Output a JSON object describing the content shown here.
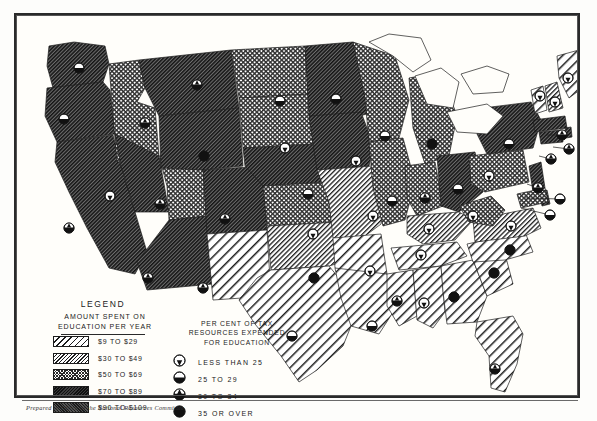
{
  "document": {
    "type": "thematic-choropleth-map",
    "region": "United States",
    "caption": "Prepared in Office of the National Resources Committee"
  },
  "legend": {
    "title": "LEGEND",
    "subtitle_line1": "AMOUNT SPENT ON",
    "subtitle_line2": "EDUCATION PER YEAR",
    "swatches": [
      {
        "label": "$9 TO $29",
        "pattern": "wide-diagonal-hatch",
        "class": "p1"
      },
      {
        "label": "$30 TO $49",
        "pattern": "dense-diagonal-hatch",
        "class": "p2"
      },
      {
        "label": "$50 TO $69",
        "pattern": "crosshatch",
        "class": "p3"
      },
      {
        "label": "$70 TO $89",
        "pattern": "dark-diagonal-hatch",
        "class": "p4"
      },
      {
        "label": "$90 TO $109",
        "pattern": "dense-stipple",
        "class": "p5"
      }
    ],
    "symbol_header_line1": "PER CENT OF TAX",
    "symbol_header_line2": "RESOURCES EXPENDED",
    "symbol_header_line3": "FOR EDUCATION",
    "symbols": [
      {
        "label": "LESS THAN 25",
        "icon": "circle-mostly-white",
        "fill": 0.18
      },
      {
        "label": "25  TO  29",
        "icon": "circle-half-dark",
        "fill": 0.5
      },
      {
        "label": "30  TO  34",
        "icon": "circle-mostly-dark",
        "fill": 0.8
      },
      {
        "label": "35 OR OVER",
        "icon": "circle-solid-dark",
        "fill": 1.0
      }
    ]
  },
  "colors": {
    "ink": "#1c1c1c",
    "paper": "#fffefa",
    "frame": "#2a2a2a"
  },
  "chart_data": {
    "type": "map",
    "value_field": "spending_tier",
    "symbol_field": "tax_percent_tier",
    "tiers": [
      "$9 TO $29",
      "$30 TO $49",
      "$50 TO $69",
      "$70 TO $89",
      "$90 TO $109"
    ],
    "symbol_tiers": [
      "LESS THAN 25",
      "25 TO 29",
      "30 TO 34",
      "35 OR OVER"
    ],
    "states": [
      {
        "name": "WA",
        "tier": 4,
        "sym": 1,
        "cx": 62,
        "cy": 52,
        "lx": 62,
        "ly": 52
      },
      {
        "name": "OR",
        "tier": 4,
        "sym": 1,
        "cx": 47,
        "cy": 103,
        "lx": 47,
        "ly": 103
      },
      {
        "name": "CA",
        "tier": 4,
        "sym": 2,
        "cx": 52,
        "cy": 212,
        "lx": 52,
        "ly": 212
      },
      {
        "name": "ID",
        "tier": 3,
        "sym": 2,
        "cx": 128,
        "cy": 107,
        "lx": 128,
        "ly": 107
      },
      {
        "name": "NV",
        "tier": 4,
        "sym": 0,
        "cx": 93,
        "cy": 180,
        "lx": 93,
        "ly": 180
      },
      {
        "name": "UT",
        "tier": 3,
        "sym": 2,
        "cx": 143,
        "cy": 188,
        "lx": 143,
        "ly": 188
      },
      {
        "name": "AZ",
        "tier": 4,
        "sym": 2,
        "cx": 131,
        "cy": 262,
        "lx": 131,
        "ly": 262
      },
      {
        "name": "MT",
        "tier": 4,
        "sym": 2,
        "cx": 180,
        "cy": 69,
        "lx": 180,
        "ly": 69
      },
      {
        "name": "WY",
        "tier": 4,
        "sym": 3,
        "cx": 187,
        "cy": 140,
        "lx": 187,
        "ly": 140
      },
      {
        "name": "CO",
        "tier": 4,
        "sym": 2,
        "cx": 208,
        "cy": 203,
        "lx": 208,
        "ly": 203
      },
      {
        "name": "NM",
        "tier": 1,
        "sym": 2,
        "cx": 186,
        "cy": 272,
        "lx": 186,
        "ly": 272
      },
      {
        "name": "ND",
        "tier": 3,
        "sym": 1,
        "cx": 263,
        "cy": 85,
        "lx": 263,
        "ly": 85
      },
      {
        "name": "SD",
        "tier": 3,
        "sym": 0,
        "cx": 268,
        "cy": 132,
        "lx": 268,
        "ly": 132
      },
      {
        "name": "NE",
        "tier": 4,
        "sym": 1,
        "cx": 291,
        "cy": 178,
        "lx": 291,
        "ly": 178
      },
      {
        "name": "KS",
        "tier": 3,
        "sym": 0,
        "cx": 296,
        "cy": 218,
        "lx": 296,
        "ly": 218
      },
      {
        "name": "OK",
        "tier": 2,
        "sym": 3,
        "cx": 297,
        "cy": 262,
        "lx": 297,
        "ly": 262
      },
      {
        "name": "TX",
        "tier": 1,
        "sym": 1,
        "cx": 275,
        "cy": 320,
        "lx": 275,
        "ly": 320
      },
      {
        "name": "MN",
        "tier": 4,
        "sym": 1,
        "cx": 319,
        "cy": 83,
        "lx": 319,
        "ly": 83
      },
      {
        "name": "IA",
        "tier": 4,
        "sym": 0,
        "cx": 339,
        "cy": 145,
        "lx": 339,
        "ly": 145
      },
      {
        "name": "MO",
        "tier": 2,
        "sym": 0,
        "cx": 356,
        "cy": 200,
        "lx": 356,
        "ly": 200
      },
      {
        "name": "AR",
        "tier": 1,
        "sym": 0,
        "cx": 353,
        "cy": 255,
        "lx": 353,
        "ly": 255
      },
      {
        "name": "LA",
        "tier": 1,
        "sym": 1,
        "cx": 355,
        "cy": 310,
        "lx": 355,
        "ly": 310
      },
      {
        "name": "WI",
        "tier": 3,
        "sym": 1,
        "cx": 368,
        "cy": 120,
        "lx": 368,
        "ly": 120
      },
      {
        "name": "IL",
        "tier": 3,
        "sym": 1,
        "cx": 375,
        "cy": 185,
        "lx": 375,
        "ly": 185
      },
      {
        "name": "MI",
        "tier": 3,
        "sym": 3,
        "cx": 415,
        "cy": 128,
        "lx": 415,
        "ly": 128
      },
      {
        "name": "IN",
        "tier": 3,
        "sym": 2,
        "cx": 408,
        "cy": 182,
        "lx": 408,
        "ly": 182
      },
      {
        "name": "OH",
        "tier": 4,
        "sym": 1,
        "cx": 441,
        "cy": 173,
        "lx": 441,
        "ly": 173
      },
      {
        "name": "KY",
        "tier": 2,
        "sym": 0,
        "cx": 412,
        "cy": 213,
        "lx": 412,
        "ly": 213
      },
      {
        "name": "TN",
        "tier": 1,
        "sym": 0,
        "cx": 404,
        "cy": 239,
        "lx": 404,
        "ly": 239
      },
      {
        "name": "MS",
        "tier": 1,
        "sym": 2,
        "cx": 380,
        "cy": 285,
        "lx": 380,
        "ly": 285
      },
      {
        "name": "AL",
        "tier": 1,
        "sym": 0,
        "cx": 407,
        "cy": 287,
        "lx": 407,
        "ly": 287
      },
      {
        "name": "GA",
        "tier": 1,
        "sym": 3,
        "cx": 437,
        "cy": 281,
        "lx": 437,
        "ly": 281
      },
      {
        "name": "FL",
        "tier": 1,
        "sym": 2,
        "cx": 478,
        "cy": 353,
        "lx": 478,
        "ly": 353
      },
      {
        "name": "SC",
        "tier": 1,
        "sym": 3,
        "cx": 477,
        "cy": 257,
        "lx": 477,
        "ly": 257
      },
      {
        "name": "NC",
        "tier": 1,
        "sym": 3,
        "cx": 493,
        "cy": 234,
        "lx": 493,
        "ly": 234
      },
      {
        "name": "VA",
        "tier": 2,
        "sym": 0,
        "cx": 494,
        "cy": 210,
        "lx": 494,
        "ly": 210
      },
      {
        "name": "WV",
        "tier": 3,
        "sym": 0,
        "cx": 456,
        "cy": 200,
        "lx": 456,
        "ly": 200
      },
      {
        "name": "PA",
        "tier": 3,
        "sym": 0,
        "cx": 472,
        "cy": 160,
        "lx": 472,
        "ly": 160
      },
      {
        "name": "NY",
        "tier": 4,
        "sym": 1,
        "cx": 492,
        "cy": 128,
        "lx": 492,
        "ly": 128
      },
      {
        "name": "VT",
        "tier": 1,
        "sym": 0,
        "cx": 523,
        "cy": 80,
        "lx": 523,
        "ly": 80
      },
      {
        "name": "NH",
        "tier": 2,
        "sym": 0,
        "cx": 538,
        "cy": 86,
        "lx": 538,
        "ly": 86
      },
      {
        "name": "ME",
        "tier": 1,
        "sym": 0,
        "cx": 551,
        "cy": 62,
        "lx": 551,
        "ly": 62
      },
      {
        "name": "MA",
        "tier": 4,
        "sym": 2,
        "cx": 545,
        "cy": 119,
        "lx": 529,
        "ly": 119
      },
      {
        "name": "RI",
        "tier": 4,
        "sym": 2,
        "cx": 552,
        "cy": 133,
        "lx": 536,
        "ly": 131
      },
      {
        "name": "CT",
        "tier": 4,
        "sym": 2,
        "cx": 534,
        "cy": 143,
        "lx": 522,
        "ly": 140
      },
      {
        "name": "NJ",
        "tier": 4,
        "sym": 2,
        "cx": 521,
        "cy": 172,
        "lx": 510,
        "ly": 168
      },
      {
        "name": "DE",
        "tier": 4,
        "sym": 1,
        "cx": 543,
        "cy": 183,
        "lx": 508,
        "ly": 182
      },
      {
        "name": "MD",
        "tier": 3,
        "sym": 1,
        "cx": 533,
        "cy": 199,
        "lx": 504,
        "ly": 192
      }
    ]
  }
}
